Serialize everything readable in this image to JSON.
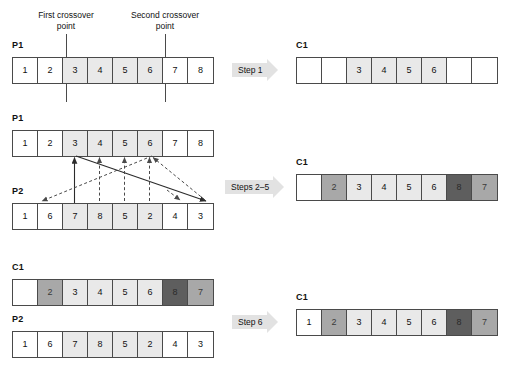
{
  "diagram": {
    "colors": {
      "white": "#ffffff",
      "light_gray": "#e9e9e9",
      "medium_gray": "#a8a8a8",
      "dark_gray": "#5e5e5e",
      "outline": "#4a4a4a",
      "arrow_fill": "#e2e2e2"
    }
  },
  "annotations": {
    "first_crossover_point": "First crossover\npoint",
    "first_crossover_point_line1": "First crossover",
    "first_crossover_point_line2": "point",
    "second_crossover_point_line1": "Second crossover",
    "second_crossover_point_line2": "point"
  },
  "steps": [
    {
      "id": "step1",
      "label": "Step 1"
    },
    {
      "id": "steps2to5",
      "label": "Steps 2–5"
    },
    {
      "id": "step6",
      "label": "Step 6"
    }
  ],
  "rows": {
    "p1_top": {
      "label": "P1",
      "cells": [
        {
          "value": "1",
          "shade": "white"
        },
        {
          "value": "2",
          "shade": "white"
        },
        {
          "value": "3",
          "shade": "light"
        },
        {
          "value": "4",
          "shade": "light"
        },
        {
          "value": "5",
          "shade": "light"
        },
        {
          "value": "6",
          "shade": "light"
        },
        {
          "value": "7",
          "shade": "white"
        },
        {
          "value": "8",
          "shade": "white"
        }
      ]
    },
    "c1_step1": {
      "label": "C1",
      "cells": [
        {
          "value": "",
          "shade": "white"
        },
        {
          "value": "",
          "shade": "white"
        },
        {
          "value": "3",
          "shade": "light"
        },
        {
          "value": "4",
          "shade": "light"
        },
        {
          "value": "5",
          "shade": "light"
        },
        {
          "value": "6",
          "shade": "light"
        },
        {
          "value": "",
          "shade": "white"
        },
        {
          "value": "",
          "shade": "white"
        }
      ]
    },
    "p1_mid": {
      "label": "P1",
      "cells": [
        {
          "value": "1",
          "shade": "white"
        },
        {
          "value": "2",
          "shade": "white"
        },
        {
          "value": "3",
          "shade": "light"
        },
        {
          "value": "4",
          "shade": "light"
        },
        {
          "value": "5",
          "shade": "light"
        },
        {
          "value": "6",
          "shade": "light"
        },
        {
          "value": "7",
          "shade": "white"
        },
        {
          "value": "8",
          "shade": "white"
        }
      ]
    },
    "p2_mid": {
      "label": "P2",
      "cells": [
        {
          "value": "1",
          "shade": "white"
        },
        {
          "value": "6",
          "shade": "white"
        },
        {
          "value": "7",
          "shade": "light"
        },
        {
          "value": "8",
          "shade": "light"
        },
        {
          "value": "5",
          "shade": "light"
        },
        {
          "value": "2",
          "shade": "light"
        },
        {
          "value": "4",
          "shade": "white"
        },
        {
          "value": "3",
          "shade": "white"
        }
      ]
    },
    "c1_steps2to5": {
      "label": "C1",
      "cells": [
        {
          "value": "",
          "shade": "white"
        },
        {
          "value": "2",
          "shade": "medium"
        },
        {
          "value": "3",
          "shade": "light"
        },
        {
          "value": "4",
          "shade": "light"
        },
        {
          "value": "5",
          "shade": "light"
        },
        {
          "value": "6",
          "shade": "light"
        },
        {
          "value": "8",
          "shade": "dark"
        },
        {
          "value": "7",
          "shade": "medium"
        }
      ]
    },
    "c1_bottom": {
      "label": "C1",
      "cells": [
        {
          "value": "",
          "shade": "white"
        },
        {
          "value": "2",
          "shade": "medium"
        },
        {
          "value": "3",
          "shade": "light"
        },
        {
          "value": "4",
          "shade": "light"
        },
        {
          "value": "5",
          "shade": "light"
        },
        {
          "value": "6",
          "shade": "light"
        },
        {
          "value": "8",
          "shade": "dark"
        },
        {
          "value": "7",
          "shade": "medium"
        }
      ]
    },
    "p2_bottom": {
      "label": "P2",
      "cells": [
        {
          "value": "1",
          "shade": "white"
        },
        {
          "value": "6",
          "shade": "white"
        },
        {
          "value": "7",
          "shade": "light"
        },
        {
          "value": "8",
          "shade": "light"
        },
        {
          "value": "5",
          "shade": "light"
        },
        {
          "value": "2",
          "shade": "light"
        },
        {
          "value": "4",
          "shade": "white"
        },
        {
          "value": "3",
          "shade": "white"
        }
      ]
    },
    "c1_step6": {
      "label": "C1",
      "cells": [
        {
          "value": "1",
          "shade": "white"
        },
        {
          "value": "2",
          "shade": "medium"
        },
        {
          "value": "3",
          "shade": "light"
        },
        {
          "value": "4",
          "shade": "light"
        },
        {
          "value": "5",
          "shade": "light"
        },
        {
          "value": "6",
          "shade": "light"
        },
        {
          "value": "8",
          "shade": "dark"
        },
        {
          "value": "7",
          "shade": "medium"
        }
      ]
    }
  }
}
